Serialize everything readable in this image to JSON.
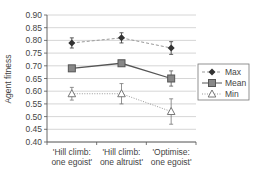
{
  "chart_data": {
    "type": "line",
    "title": "",
    "xlabel": "",
    "ylabel": "Agent fitness",
    "ylim": [
      0.4,
      0.9
    ],
    "yticks": [
      "0.90",
      "0.85",
      "0.80",
      "0.75",
      "0.70",
      "0.65",
      "0.60",
      "0.55",
      "0.50",
      "0.45",
      "0.40"
    ],
    "grid": true,
    "legend_position": "right",
    "categories": [
      [
        "'Hill climb:",
        "one egoist'"
      ],
      [
        "'Hill climb:",
        "one altruist'"
      ],
      [
        "'Optimise:",
        "one egoist'"
      ]
    ],
    "series": [
      {
        "name": "Max",
        "marker": "diamond",
        "line": "dashed",
        "values": [
          0.79,
          0.81,
          0.77
        ],
        "errors": [
          0.02,
          0.02,
          0.025
        ]
      },
      {
        "name": "Mean",
        "marker": "square",
        "line": "solid",
        "values": [
          0.69,
          0.71,
          0.65
        ],
        "errors": [
          0.01,
          0.01,
          0.03
        ]
      },
      {
        "name": "Min",
        "marker": "triangle",
        "line": "dotted",
        "values": [
          0.59,
          0.59,
          0.52
        ],
        "errors": [
          0.025,
          0.04,
          0.05
        ]
      }
    ]
  },
  "colors": {
    "grid": "#cccccc",
    "axis": "#555555",
    "max": "#333333",
    "mean": "#555555",
    "min": "#777777"
  }
}
